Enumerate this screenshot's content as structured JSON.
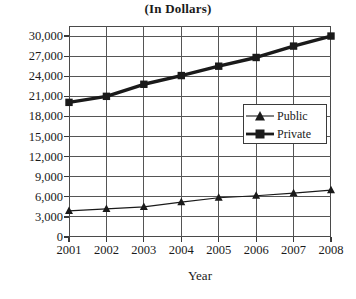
{
  "chart_data": {
    "type": "line",
    "title": "(In Dollars)",
    "subtitle": "",
    "xlabel": "Year",
    "ylabel": "",
    "categories": [
      "2001",
      "2002",
      "2003",
      "2004",
      "2005",
      "2006",
      "2007",
      "2008"
    ],
    "x": [
      2001,
      2002,
      2003,
      2004,
      2005,
      2006,
      2007,
      2008
    ],
    "series": [
      {
        "name": "Public",
        "marker": "triangle",
        "line_width": "thin",
        "color": "#1a1a1a",
        "values": [
          3900,
          4200,
          4500,
          5200,
          5850,
          6150,
          6550,
          7000
        ]
      },
      {
        "name": "Private",
        "marker": "square",
        "line_width": "thick",
        "color": "#1a1a1a",
        "values": [
          20100,
          21000,
          22800,
          24100,
          25500,
          26800,
          28500,
          30000
        ]
      }
    ],
    "ylim": [
      0,
      31500
    ],
    "yticks": [
      0,
      3000,
      6000,
      9000,
      12000,
      15000,
      18000,
      21000,
      24000,
      27000,
      30000
    ],
    "ytick_labels": [
      "0",
      "3,000",
      "6,000",
      "9,000",
      "12,000",
      "15,000",
      "18,000",
      "21,000",
      "24,000",
      "27,000",
      "30,000"
    ],
    "xlim": [
      2001,
      2008
    ],
    "grid": true,
    "grid_color": "#555555",
    "legend_position": "center-right",
    "legend_entries": [
      "Public",
      "Private"
    ],
    "background": "#ffffff"
  }
}
